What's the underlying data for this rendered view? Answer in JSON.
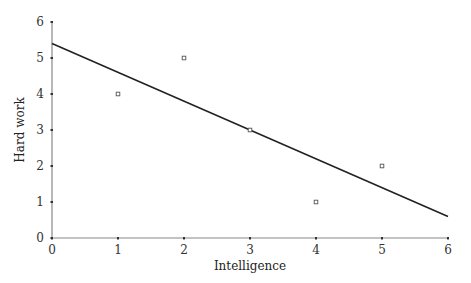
{
  "chart_data": {
    "type": "scatter",
    "title": "",
    "xlabel": "Intelligence",
    "ylabel": "Hard work",
    "xlim": [
      0,
      6
    ],
    "ylim": [
      0,
      6
    ],
    "x_ticks": [
      "0",
      "1",
      "2",
      "3",
      "4",
      "5",
      "6"
    ],
    "y_ticks": [
      "0",
      "1",
      "2",
      "3",
      "4",
      "5",
      "6"
    ],
    "grid": false,
    "legend": null,
    "series": [
      {
        "name": "observations",
        "marker": "open-square",
        "points": [
          {
            "x": 1,
            "y": 4
          },
          {
            "x": 2,
            "y": 5
          },
          {
            "x": 3,
            "y": 3
          },
          {
            "x": 4,
            "y": 1
          },
          {
            "x": 5,
            "y": 2
          }
        ]
      },
      {
        "name": "regression-line",
        "type": "line",
        "points": [
          {
            "x": 0,
            "y": 5.4
          },
          {
            "x": 6,
            "y": 0.6
          }
        ]
      }
    ]
  },
  "colors": {
    "axis": "#888888",
    "line": "#222222",
    "marker": "#555555"
  }
}
